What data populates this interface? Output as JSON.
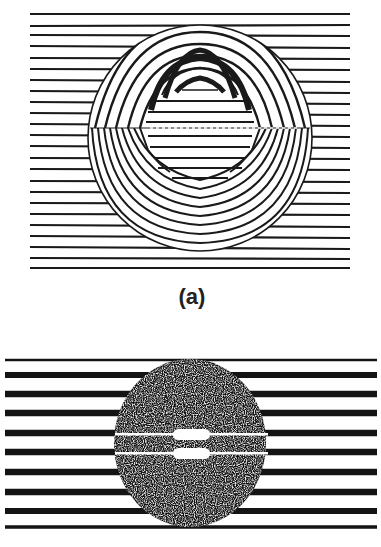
{
  "figure": {
    "panels": [
      {
        "id": "a",
        "caption": "(a)",
        "description": "Interference fringe pattern with circular region of curved fringes",
        "fringe_color": "#1a1a1a",
        "background": "#ffffff"
      },
      {
        "id": "b",
        "caption": "",
        "description": "Interference fringe pattern with dark speckled circular region and two white horizontal slits",
        "fringe_color": "#141414",
        "background": "#ffffff"
      }
    ]
  }
}
